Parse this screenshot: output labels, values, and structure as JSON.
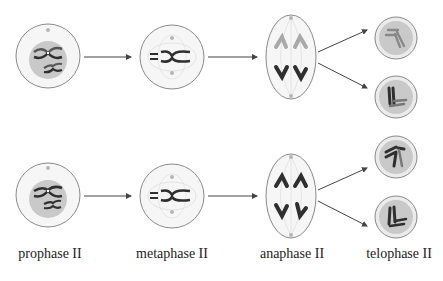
{
  "stages": [
    {
      "label": "prophase II",
      "x": 50
    },
    {
      "label": "metaphase II",
      "x": 172
    },
    {
      "label": "anaphase II",
      "x": 296
    },
    {
      "label": "telophase II",
      "x": 399
    }
  ],
  "colors": {
    "outline": "#8a8a8a",
    "cell_fill": "#f4f4f4",
    "nucleus_fill": "#c9c9c9",
    "chrom_dark": "#2f2f2f",
    "chrom_light": "#a9a9a9",
    "centrosome": "#b5b5b5",
    "arrow": "#444444"
  },
  "rows": [
    "top-row",
    "bottom-row"
  ]
}
